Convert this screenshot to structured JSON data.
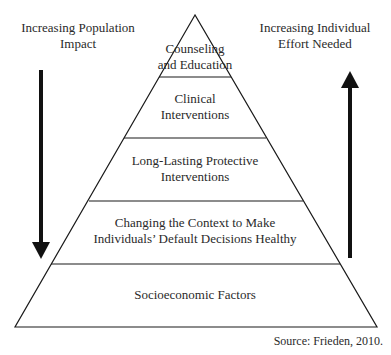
{
  "left_label": {
    "line1": "Increasing Population",
    "line2": "Impact"
  },
  "right_label": {
    "line1": "Increasing Individual",
    "line2": "Effort Needed"
  },
  "pyramid": {
    "tiers": [
      {
        "line1": "Counseling",
        "line2": "and Education"
      },
      {
        "line1": "Clinical",
        "line2": "Interventions"
      },
      {
        "line1": "Long-Lasting Protective",
        "line2": "Interventions"
      },
      {
        "line1": "Changing the Context to Make",
        "line2": "Individuals’ Default Decisions Healthy"
      },
      {
        "line1": "Socioeconomic Factors"
      }
    ]
  },
  "source": "Source: Frieden, 2010.",
  "colors": {
    "line": "#1a1a1a",
    "text": "#2a2a2a"
  }
}
